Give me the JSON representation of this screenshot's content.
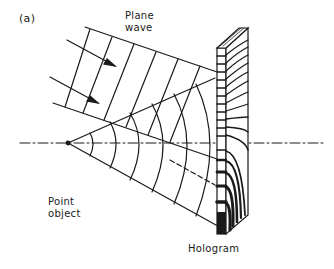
{
  "figure": {
    "panel_label": "(a)",
    "labels": {
      "plane_wave": [
        "Plane",
        "wave"
      ],
      "point_object": [
        "Point",
        "object"
      ],
      "hologram": "Hologram"
    },
    "colors": {
      "ink": "#1a1a1a",
      "background": "#ffffff"
    }
  }
}
